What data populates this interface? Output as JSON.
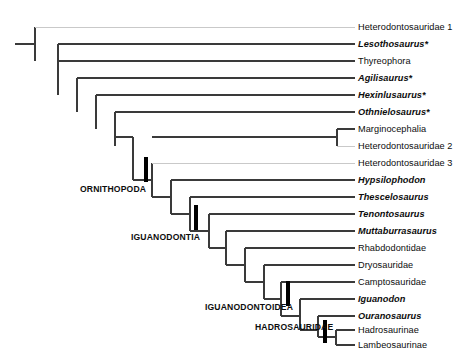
{
  "figure": {
    "kind": "cladogram",
    "line_color": "#3a3a3a",
    "faint_line_color": "#c9c9c9",
    "node_marker_color": "#000000",
    "background": "#ffffff"
  },
  "taxa": [
    {
      "id": "heterodontosauridae1",
      "label": "Heterodontosauridae 1",
      "italic": false,
      "label_x": 358,
      "y": 27,
      "branch_x": 35,
      "faint": true
    },
    {
      "id": "lesothosaurus",
      "label": "Lesothosaurus*",
      "italic": true,
      "label_x": 358,
      "y": 44,
      "branch_x": 58,
      "faint": false
    },
    {
      "id": "thyreophora",
      "label": "Thyreophora",
      "italic": false,
      "label_x": 358,
      "y": 61,
      "branch_x": 58,
      "faint": false
    },
    {
      "id": "agilisaurus",
      "label": "Agilisaurus*",
      "italic": true,
      "label_x": 358,
      "y": 78,
      "branch_x": 77,
      "faint": false
    },
    {
      "id": "hexinlusaurus",
      "label": "Hexinlusaurus*",
      "italic": true,
      "label_x": 358,
      "y": 95,
      "branch_x": 96,
      "faint": false
    },
    {
      "id": "othnielosaurus",
      "label": "Othnielosaurus*",
      "italic": true,
      "label_x": 358,
      "y": 112,
      "branch_x": 115,
      "faint": false
    },
    {
      "id": "marginocephalia",
      "label": "Marginocephalia",
      "italic": false,
      "label_x": 358,
      "y": 129,
      "branch_x": 337,
      "faint": false
    },
    {
      "id": "heterodontosauridae2",
      "label": "Heterodontosauridae 2",
      "italic": false,
      "label_x": 358,
      "y": 146,
      "branch_x": 337,
      "faint": true
    },
    {
      "id": "heterodontosauridae3",
      "label": "Heterodontosauridae 3",
      "italic": false,
      "label_x": 358,
      "y": 163,
      "branch_x": 152,
      "faint": true
    },
    {
      "id": "hypsilophodon",
      "label": "Hypsilophodon",
      "italic": true,
      "label_x": 358,
      "y": 180,
      "branch_x": 171,
      "faint": false
    },
    {
      "id": "thescelosaurus",
      "label": "Thescelosaurus",
      "italic": true,
      "label_x": 358,
      "y": 197,
      "branch_x": 190,
      "faint": false
    },
    {
      "id": "tenontosaurus",
      "label": "Tenontosaurus",
      "italic": true,
      "label_x": 358,
      "y": 214,
      "branch_x": 209,
      "faint": false
    },
    {
      "id": "muttaburrasaurus",
      "label": "Muttaburrasaurus",
      "italic": true,
      "label_x": 358,
      "y": 231,
      "branch_x": 226,
      "faint": false
    },
    {
      "id": "rhabdodontidae",
      "label": "Rhabdodontidae",
      "italic": false,
      "label_x": 358,
      "y": 248,
      "branch_x": 245,
      "faint": false
    },
    {
      "id": "dryosauridae",
      "label": "Dryosauridae",
      "italic": false,
      "label_x": 358,
      "y": 265,
      "branch_x": 264,
      "faint": false
    },
    {
      "id": "camptosauridae",
      "label": "Camptosauridae",
      "italic": false,
      "label_x": 358,
      "y": 282,
      "branch_x": 281,
      "faint": false
    },
    {
      "id": "iguanodon",
      "label": "Iguanodon",
      "italic": true,
      "label_x": 358,
      "y": 299,
      "branch_x": 300,
      "faint": false
    },
    {
      "id": "ouranosaurus",
      "label": "Ouranosaurus",
      "italic": true,
      "label_x": 358,
      "y": 316,
      "branch_x": 318,
      "faint": false
    },
    {
      "id": "hadrosaurinae",
      "label": "Hadrosaurinae",
      "italic": false,
      "label_x": 358,
      "y": 330,
      "branch_x": 336,
      "faint": false
    },
    {
      "id": "lambeosaurinae",
      "label": "Lambeosaurinae",
      "italic": false,
      "label_x": 358,
      "y": 345,
      "branch_x": 336,
      "faint": false
    }
  ],
  "clade_labels": [
    {
      "id": "ornithopoda",
      "label": "ORNITHOPODA",
      "x": 80,
      "y": 190,
      "tick_x": 146,
      "tick_y1": 157,
      "tick_y2": 182
    },
    {
      "id": "iguanodontia",
      "label": "IGUANODONTIA",
      "x": 131,
      "y": 238,
      "tick_x": 196,
      "tick_y1": 205,
      "tick_y2": 230
    },
    {
      "id": "iguanodontoidea",
      "label": "IGUANODONTOIDEA",
      "x": 205,
      "y": 308,
      "tick_x": 288,
      "tick_y1": 281,
      "tick_y2": 306
    },
    {
      "id": "hadrosauridae",
      "label": "HADROSAURIDAE",
      "x": 255,
      "y": 328,
      "tick_x": 325,
      "tick_y1": 320,
      "tick_y2": 343
    }
  ],
  "root": {
    "x_start": 15,
    "x_end": 35,
    "y": 44
  },
  "internal_nodes": [
    {
      "id": "node-root",
      "x": 35,
      "y_top": 27,
      "y_bottom": 61
    },
    {
      "id": "node-lesothosaurus",
      "x": 58,
      "y_top": 44,
      "y_bottom": 95
    },
    {
      "id": "node-agilisaurus",
      "x": 77,
      "y_top": 78,
      "y_bottom": 112
    },
    {
      "id": "node-hexinlusaurus",
      "x": 96,
      "y_top": 95,
      "y_bottom": 129
    },
    {
      "id": "node-othnielosaurus",
      "x": 115,
      "y_top": 112,
      "y_bottom": 146
    },
    {
      "id": "node-marginoceph",
      "x": 337,
      "y_top": 129,
      "y_bottom": 146
    },
    {
      "id": "node-ornithopoda",
      "x": 133,
      "y_top": 137,
      "y_bottom": 180
    },
    {
      "id": "node-het3",
      "x": 152,
      "y_top": 163,
      "y_bottom": 197
    },
    {
      "id": "node-hypsilophodon",
      "x": 171,
      "y_top": 180,
      "y_bottom": 214
    },
    {
      "id": "node-thescelosaurus",
      "x": 190,
      "y_top": 197,
      "y_bottom": 231
    },
    {
      "id": "node-iguanodontia",
      "x": 209,
      "y_top": 214,
      "y_bottom": 248
    },
    {
      "id": "node-muttaburra",
      "x": 226,
      "y_top": 231,
      "y_bottom": 265
    },
    {
      "id": "node-rhabdodontidae",
      "x": 245,
      "y_top": 248,
      "y_bottom": 282
    },
    {
      "id": "node-dryosauridae",
      "x": 264,
      "y_top": 265,
      "y_bottom": 299
    },
    {
      "id": "node-camptosauridae",
      "x": 281,
      "y_top": 282,
      "y_bottom": 316
    },
    {
      "id": "node-iguanodontoidea",
      "x": 300,
      "y_top": 299,
      "y_bottom": 330
    },
    {
      "id": "node-hadrosauridae",
      "x": 318,
      "y_top": 316,
      "y_bottom": 337
    },
    {
      "id": "node-hadro-split",
      "x": 336,
      "y_top": 330,
      "y_bottom": 345
    }
  ],
  "connectors": [
    {
      "id": "conn-ornithopoda",
      "x1": 115,
      "x2": 133,
      "y": 137
    },
    {
      "id": "conn-het3",
      "x1": 133,
      "x2": 152,
      "y": 180
    },
    {
      "id": "conn-hypsi",
      "x1": 152,
      "x2": 171,
      "y": 197
    },
    {
      "id": "conn-thescelo",
      "x1": 171,
      "x2": 190,
      "y": 214
    },
    {
      "id": "conn-iguanodontia",
      "x1": 190,
      "x2": 209,
      "y": 231
    },
    {
      "id": "conn-muttaburra",
      "x1": 209,
      "x2": 226,
      "y": 248
    },
    {
      "id": "conn-rhabdo",
      "x1": 226,
      "x2": 245,
      "y": 265
    },
    {
      "id": "conn-dryo",
      "x1": 245,
      "x2": 264,
      "y": 282
    },
    {
      "id": "conn-campto",
      "x1": 264,
      "x2": 281,
      "y": 299
    },
    {
      "id": "conn-iguanodontoidea",
      "x1": 281,
      "x2": 300,
      "y": 316
    },
    {
      "id": "conn-hadrosauridae",
      "x1": 300,
      "x2": 318,
      "y": 330
    },
    {
      "id": "conn-hadro-split",
      "x1": 318,
      "x2": 336,
      "y": 337
    },
    {
      "id": "conn-marginoceph",
      "x1": 152,
      "x2": 337,
      "y": 137
    }
  ]
}
